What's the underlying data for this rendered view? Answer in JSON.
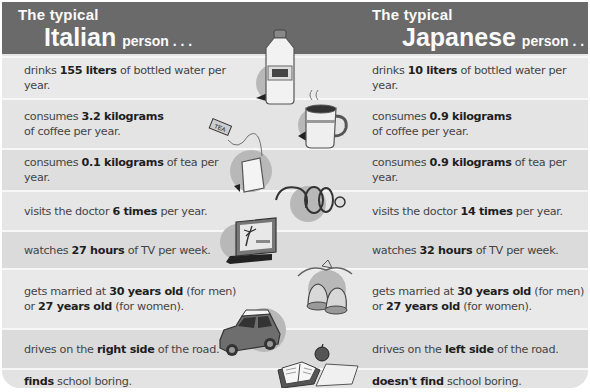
{
  "header": {
    "left": {
      "prefix": "The typical",
      "nationality": "Italian",
      "suffix": "person . . ."
    },
    "right": {
      "prefix": "The typical",
      "nationality": "Japanese",
      "suffix": "person . . ."
    }
  },
  "rows": [
    {
      "icon": "water-bottle-icon",
      "italian": {
        "pre": "drinks ",
        "bold": "155 liters",
        "post": " of bottled water per year."
      },
      "japanese": {
        "pre": "drinks ",
        "bold": "10 liters",
        "post": " of bottled water  per year."
      }
    },
    {
      "icon": "coffee-mug-icon",
      "italian": {
        "pre": "consumes ",
        "bold": "3.2 kilograms",
        "post": " of coffee per year."
      },
      "japanese": {
        "pre": "consumes ",
        "bold": "0.9 kilograms",
        "post": " of coffee per year."
      }
    },
    {
      "icon": "tea-bag-icon",
      "tag_label": "TEA",
      "italian": {
        "pre": "consumes ",
        "bold": "0.1 kilograms",
        "post": " of tea per year."
      },
      "japanese": {
        "pre": "consumes ",
        "bold": "0.9 kilograms",
        "post": " of tea per year."
      }
    },
    {
      "icon": "stethoscope-icon",
      "italian": {
        "pre": "visits the doctor ",
        "bold": "6 times",
        "post": " per year."
      },
      "japanese": {
        "pre": "visits the doctor ",
        "bold": "14 times",
        "post": " per year."
      }
    },
    {
      "icon": "television-icon",
      "italian": {
        "pre": "watches ",
        "bold": "27 hours",
        "post": " of TV per week."
      },
      "japanese": {
        "pre": "watches ",
        "bold": "32 hours",
        "post": " of TV per week."
      }
    },
    {
      "icon": "wedding-bells-icon",
      "italian": {
        "pre": "gets married at ",
        "bold": "30 years old",
        "mid": " (for men) or ",
        "bold2": "27 years old",
        "post": " (for women)."
      },
      "japanese": {
        "pre": "gets married at ",
        "bold": "30 years old",
        "mid": " (for men) or ",
        "bold2": "27 years old",
        "post": " (for women)."
      }
    },
    {
      "icon": "car-icon",
      "italian": {
        "pre": "drives on the ",
        "bold": "right side",
        "post": " of the road."
      },
      "japanese": {
        "pre": "drives on the ",
        "bold": "left side",
        "post": " of the road."
      }
    },
    {
      "icon": "book-apple-icon",
      "italian": {
        "pre": "",
        "bold": "finds",
        "post": " school boring."
      },
      "japanese": {
        "pre": "",
        "bold": "doesn't find",
        "post": " school boring."
      }
    }
  ],
  "colors": {
    "header_bg": "#6a6a6a",
    "row_light": "#e9e9e9",
    "row_dark": "#dbdbdb",
    "divider": "#f7f7f7",
    "text": "#444444",
    "bold_text": "#1e1e1e"
  }
}
